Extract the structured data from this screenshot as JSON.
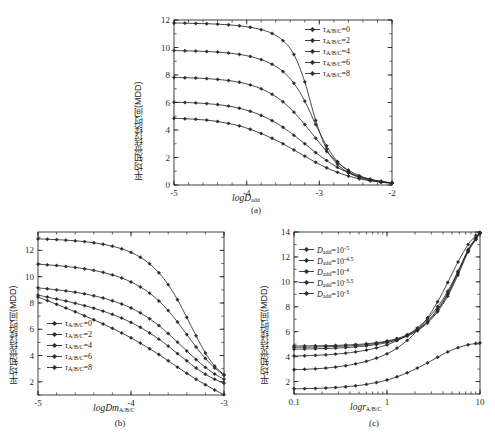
{
  "figure": {
    "background": "#ffffff",
    "line_color": "#2a2a2a",
    "width": 495,
    "height": 444
  },
  "captions": {
    "a": "(a)",
    "b": "(b)",
    "c": "(c)"
  },
  "ylabel_text": "平均知觉持续时间(MDD)",
  "chart_data": [
    {
      "id": "a",
      "type": "line",
      "title": "",
      "caption": "(a)",
      "xlabel": "logD",
      "xlabel_sub": "add",
      "ylabel": "平均知觉持续时间(MDD)",
      "xlim": [
        -5,
        -2
      ],
      "ylim": [
        0,
        12
      ],
      "xticks": [
        -5,
        -4,
        -3,
        -2
      ],
      "xticklabels": [
        "-5",
        "-4",
        "-3",
        "-2"
      ],
      "yticks": [
        0,
        2,
        4,
        6,
        8,
        10,
        12
      ],
      "yticklabels": [
        "0",
        "2",
        "4",
        "6",
        "8",
        "10",
        "12"
      ],
      "xscale": "linear",
      "grid": false,
      "legend_position": "upper-right",
      "legend_title": "",
      "x": [
        -5.0,
        -4.85,
        -4.7,
        -4.55,
        -4.4,
        -4.25,
        -4.1,
        -3.95,
        -3.8,
        -3.65,
        -3.5,
        -3.35,
        -3.2,
        -3.05,
        -2.9,
        -2.75,
        -2.6,
        -2.45,
        -2.3,
        -2.15,
        -2.0
      ],
      "series": [
        {
          "name": "τ_A/B/C=0",
          "label_base": "τ",
          "label_sub": "A/B/C",
          "label_value": "0",
          "values": [
            4.85,
            4.82,
            4.78,
            4.72,
            4.62,
            4.48,
            4.3,
            4.05,
            3.75,
            3.4,
            3.0,
            2.55,
            2.1,
            1.65,
            1.25,
            0.92,
            0.65,
            0.45,
            0.3,
            0.2,
            0.12
          ]
        },
        {
          "name": "τ_A/B/C=2",
          "label_base": "τ",
          "label_sub": "A/B/C",
          "label_value": "2",
          "values": [
            6.02,
            6.0,
            5.97,
            5.92,
            5.85,
            5.74,
            5.58,
            5.36,
            5.06,
            4.68,
            4.2,
            3.62,
            3.0,
            2.36,
            1.78,
            1.28,
            0.9,
            0.6,
            0.4,
            0.25,
            0.15
          ]
        },
        {
          "name": "τ_A/B/C=4",
          "label_base": "τ",
          "label_sub": "A/B/C",
          "label_value": "4",
          "values": [
            7.82,
            7.8,
            7.78,
            7.74,
            7.68,
            7.6,
            7.47,
            7.28,
            7.0,
            6.6,
            6.05,
            5.3,
            4.4,
            3.4,
            2.45,
            1.65,
            1.08,
            0.68,
            0.42,
            0.27,
            0.16
          ]
        },
        {
          "name": "τ_A/B/C=6",
          "label_base": "τ",
          "label_sub": "A/B/C",
          "label_value": "6",
          "values": [
            9.78,
            9.76,
            9.74,
            9.71,
            9.67,
            9.6,
            9.5,
            9.35,
            9.12,
            8.78,
            8.25,
            7.4,
            6.1,
            4.4,
            2.85,
            1.7,
            1.0,
            0.6,
            0.38,
            0.24,
            0.15
          ]
        },
        {
          "name": "τ_A/B/C=8",
          "label_base": "τ",
          "label_sub": "A/B/C",
          "label_value": "8",
          "values": [
            11.78,
            11.77,
            11.75,
            11.73,
            11.7,
            11.65,
            11.58,
            11.47,
            11.3,
            11.02,
            10.5,
            9.5,
            7.5,
            4.7,
            2.6,
            1.5,
            0.9,
            0.55,
            0.35,
            0.22,
            0.14
          ]
        }
      ]
    },
    {
      "id": "b",
      "type": "line",
      "caption": "(b)",
      "xlabel": "logDm",
      "xlabel_sub": "A/B/C",
      "ylabel": "平均知觉持续时间(MDD)",
      "xlim": [
        -5,
        -3
      ],
      "ylim": [
        1,
        13.4
      ],
      "xticks": [
        -5,
        -4,
        -3
      ],
      "xticklabels": [
        "-5",
        "-4",
        "-3"
      ],
      "yticks": [
        2,
        4,
        6,
        8,
        10,
        12
      ],
      "yticklabels": [
        "2",
        "4",
        "6",
        "8",
        "10",
        "12"
      ],
      "xscale": "linear",
      "grid": false,
      "legend_position": "lower-left",
      "x": [
        -5.0,
        -4.9,
        -4.8,
        -4.7,
        -4.6,
        -4.5,
        -4.4,
        -4.3,
        -4.2,
        -4.1,
        -4.0,
        -3.9,
        -3.8,
        -3.7,
        -3.6,
        -3.5,
        -3.4,
        -3.3,
        -3.2,
        -3.1,
        -3.0
      ],
      "series": [
        {
          "name": "τ_A/B/C=0",
          "label_base": "τ",
          "label_sub": "A/B/C",
          "label_value": "0",
          "values": [
            8.45,
            8.18,
            7.9,
            7.62,
            7.33,
            7.03,
            6.72,
            6.4,
            6.07,
            5.72,
            5.35,
            4.95,
            4.52,
            4.08,
            3.6,
            3.12,
            2.65,
            2.2,
            1.78,
            1.38,
            1.0
          ]
        },
        {
          "name": "τ_A/B/C=2",
          "label_base": "τ",
          "label_sub": "A/B/C",
          "label_value": "2",
          "values": [
            8.6,
            8.45,
            8.3,
            8.15,
            7.98,
            7.8,
            7.6,
            7.38,
            7.13,
            6.85,
            6.52,
            6.15,
            5.72,
            5.25,
            4.72,
            4.15,
            3.6,
            3.05,
            2.58,
            2.2,
            1.9
          ]
        },
        {
          "name": "τ_A/B/C=4",
          "label_base": "τ",
          "label_sub": "A/B/C",
          "label_value": "4",
          "values": [
            9.15,
            9.08,
            9.0,
            8.92,
            8.82,
            8.7,
            8.55,
            8.38,
            8.17,
            7.92,
            7.62,
            7.25,
            6.8,
            6.28,
            5.68,
            5.02,
            4.35,
            3.7,
            3.1,
            2.6,
            2.2
          ]
        },
        {
          "name": "τ_A/B/C=6",
          "label_base": "τ",
          "label_sub": "A/B/C",
          "label_value": "6",
          "values": [
            10.95,
            10.9,
            10.85,
            10.78,
            10.7,
            10.6,
            10.48,
            10.33,
            10.14,
            9.9,
            9.6,
            9.22,
            8.75,
            8.15,
            7.42,
            6.55,
            5.6,
            4.65,
            3.78,
            3.05,
            2.5
          ]
        },
        {
          "name": "τ_A/B/C=8",
          "label_base": "τ",
          "label_sub": "A/B/C",
          "label_value": "8",
          "values": [
            12.88,
            12.85,
            12.82,
            12.78,
            12.73,
            12.67,
            12.58,
            12.47,
            12.32,
            12.12,
            11.85,
            11.48,
            10.98,
            10.3,
            9.4,
            8.25,
            6.9,
            5.5,
            4.2,
            3.2,
            2.55
          ]
        }
      ]
    },
    {
      "id": "c",
      "type": "line",
      "caption": "(c)",
      "xlabel": "logr",
      "xlabel_sub": "A/B/C",
      "ylabel": "平均知觉持续时间(MDD)",
      "xlim": [
        0.1,
        10
      ],
      "ylim": [
        1,
        14
      ],
      "xscale": "log",
      "xticks": [
        0.1,
        1,
        10
      ],
      "xticklabels": [
        "0.1",
        "1",
        "10"
      ],
      "yticks": [
        2,
        4,
        6,
        8,
        10,
        12,
        14
      ],
      "yticklabels": [
        "2",
        "4",
        "6",
        "8",
        "10",
        "12",
        "14"
      ],
      "grid": false,
      "legend_position": "upper-left",
      "x": [
        0.1,
        0.13,
        0.17,
        0.22,
        0.28,
        0.36,
        0.46,
        0.6,
        0.77,
        1.0,
        1.28,
        1.65,
        2.12,
        2.73,
        3.5,
        4.5,
        5.8,
        7.45,
        9.0,
        10.0
      ],
      "series": [
        {
          "name": "D_add=10^-5",
          "label_base": "D",
          "label_sub": "add",
          "label_value": "10",
          "label_exp": "-5",
          "values": [
            4.85,
            4.86,
            4.87,
            4.88,
            4.9,
            4.93,
            4.97,
            5.03,
            5.12,
            5.25,
            5.45,
            5.75,
            6.2,
            6.85,
            7.8,
            9.1,
            10.8,
            12.6,
            13.5,
            13.95
          ]
        },
        {
          "name": "D_add=10^-4.5",
          "label_base": "D",
          "label_sub": "add",
          "label_value": "10",
          "label_exp": "-4.5",
          "values": [
            4.75,
            4.76,
            4.77,
            4.79,
            4.81,
            4.85,
            4.89,
            4.96,
            5.05,
            5.19,
            5.39,
            5.69,
            6.13,
            6.78,
            7.72,
            9.0,
            10.7,
            12.5,
            13.45,
            13.92
          ]
        },
        {
          "name": "D_add=10^-4",
          "label_base": "D",
          "label_sub": "add",
          "label_value": "10",
          "label_exp": "-4",
          "values": [
            4.6,
            4.61,
            4.63,
            4.65,
            4.68,
            4.72,
            4.78,
            4.86,
            4.97,
            5.12,
            5.34,
            5.65,
            6.08,
            6.7,
            7.6,
            8.85,
            10.55,
            12.4,
            13.4,
            13.9
          ]
        },
        {
          "name": "D_add=10^-3.5",
          "label_base": "D",
          "label_sub": "add",
          "label_value": "10",
          "label_exp": "-3.5",
          "values": [
            4.05,
            4.07,
            4.1,
            4.14,
            4.2,
            4.28,
            4.38,
            4.52,
            4.7,
            4.95,
            5.28,
            5.72,
            6.3,
            7.05,
            8.0,
            9.25,
            10.85,
            12.5,
            13.4,
            13.9
          ]
        },
        {
          "name": "D_add=10^-3",
          "label_base": "D",
          "label_sub": "add",
          "label_value": "10",
          "label_exp": "-3",
          "values": [
            2.95,
            2.98,
            3.02,
            3.08,
            3.16,
            3.27,
            3.42,
            3.62,
            3.88,
            4.22,
            4.68,
            5.3,
            6.1,
            7.12,
            8.4,
            9.95,
            11.6,
            13.0,
            13.7,
            14.0
          ]
        }
      ]
    },
    {
      "id": "c_low",
      "type": "line",
      "note": "lowest curve of panel c",
      "x": [
        0.1,
        0.13,
        0.17,
        0.22,
        0.28,
        0.36,
        0.46,
        0.6,
        0.77,
        1.0,
        1.28,
        1.65,
        2.12,
        2.73,
        3.5,
        4.5,
        5.8,
        7.45,
        9.0,
        10.0
      ],
      "values": [
        1.42,
        1.43,
        1.45,
        1.48,
        1.52,
        1.58,
        1.66,
        1.77,
        1.92,
        2.12,
        2.38,
        2.7,
        3.08,
        3.5,
        3.95,
        4.38,
        4.72,
        4.95,
        5.05,
        5.1
      ]
    }
  ],
  "legends": {
    "a": [
      {
        "tau": "τ",
        "sub": "A/B/C",
        "eq": "=0"
      },
      {
        "tau": "τ",
        "sub": "A/B/C",
        "eq": "=2"
      },
      {
        "tau": "τ",
        "sub": "A/B/C",
        "eq": "=4"
      },
      {
        "tau": "τ",
        "sub": "A/B/C",
        "eq": "=6"
      },
      {
        "tau": "τ",
        "sub": "A/B/C",
        "eq": "=8"
      }
    ],
    "b": [
      {
        "tau": "τ",
        "sub": "A/B/C",
        "eq": "=0"
      },
      {
        "tau": "τ",
        "sub": "A/B/C",
        "eq": "=2"
      },
      {
        "tau": "τ",
        "sub": "A/B/C",
        "eq": "=4"
      },
      {
        "tau": "τ",
        "sub": "A/B/C",
        "eq": "=6"
      },
      {
        "tau": "τ",
        "sub": "A/B/C",
        "eq": "=8"
      }
    ],
    "c": [
      {
        "d": "D",
        "sub": "add",
        "eq": "=10",
        "exp": "-5"
      },
      {
        "d": "D",
        "sub": "add",
        "eq": "=10",
        "exp": "-4.5"
      },
      {
        "d": "D",
        "sub": "add",
        "eq": "=10",
        "exp": "-4"
      },
      {
        "d": "D",
        "sub": "add",
        "eq": "=10",
        "exp": "-3.5"
      },
      {
        "d": "D",
        "sub": "add",
        "eq": "=10",
        "exp": "-3"
      }
    ]
  },
  "axis_labels": {
    "a": {
      "base": "logD",
      "sub": "add"
    },
    "b": {
      "base": "logDm",
      "sub": "A/B/C"
    },
    "c": {
      "base": "logr",
      "sub": "A/B/C"
    }
  }
}
